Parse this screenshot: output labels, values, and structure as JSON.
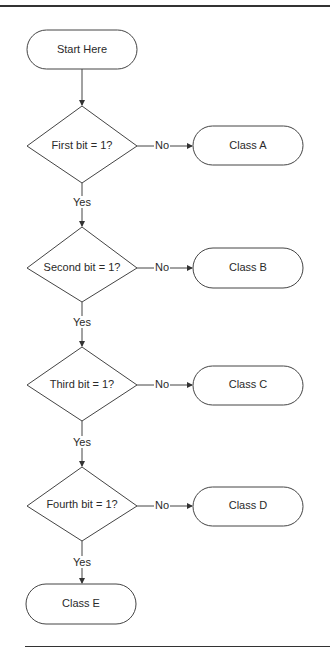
{
  "diagram": {
    "type": "flowchart",
    "start": {
      "label": "Start Here"
    },
    "decisions": [
      {
        "label": "First bit = 1?",
        "no_label": "No",
        "no_target": "Class A",
        "yes_label": "Yes"
      },
      {
        "label": "Second bit = 1?",
        "no_label": "No",
        "no_target": "Class B",
        "yes_label": "Yes"
      },
      {
        "label": "Third bit = 1?",
        "no_label": "No",
        "no_target": "Class C",
        "yes_label": "Yes"
      },
      {
        "label": "Fourth bit = 1?",
        "no_label": "No",
        "no_target": "Class D",
        "yes_label": "Yes"
      }
    ],
    "terminals": [
      {
        "label": "Class A"
      },
      {
        "label": "Class B"
      },
      {
        "label": "Class C"
      },
      {
        "label": "Class D"
      },
      {
        "label": "Class E"
      }
    ],
    "colors": {
      "stroke": "#333333",
      "text": "#222222",
      "background": "#ffffff"
    }
  }
}
